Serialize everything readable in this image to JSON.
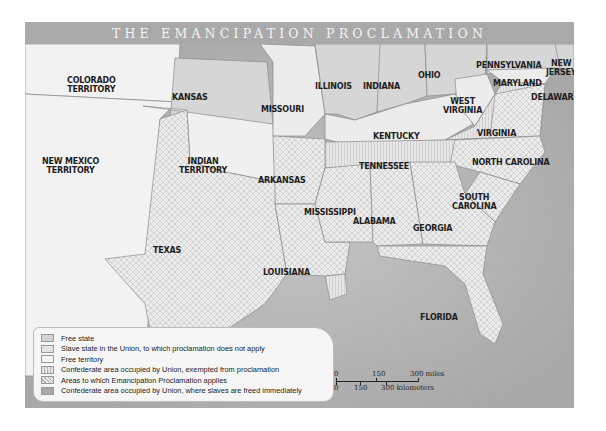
{
  "title": "THE EMANCIPATION PROCLAMATION",
  "colors": {
    "free_state": "#d2d2d2",
    "slave_state_union": "#ececec",
    "free_territory": "#f2f2f2",
    "confederate_exempted": "#e2e2e2",
    "proclamation_applies": "#ebebeb",
    "confederate_freed_immediately": "#a8a8a8",
    "water": "#bdbdbd",
    "title_bar": "#a9a9a9"
  },
  "regions": {
    "colorado": "COLORADO\nTERRITORY",
    "kansas": "KANSAS",
    "missouri": "MISSOURI",
    "illinois": "ILLINOIS",
    "indiana": "INDIANA",
    "ohio": "OHIO",
    "pennsylvania": "PENNSYLVANIA",
    "new_jersey": "NEW\nJERSEY",
    "maryland": "MARYLAND",
    "delaware": "DELAWARE",
    "west_virginia": "WEST\nVIRGINIA",
    "virginia": "VIRGINIA",
    "kentucky": "KENTUCKY",
    "new_mexico": "NEW MEXICO\nTERRITORY",
    "indian_territory": "INDIAN\nTERRITORY",
    "arkansas": "ARKANSAS",
    "tennessee": "TENNESSEE",
    "north_carolina": "NORTH CAROLINA",
    "south_carolina": "SOUTH\nCAROLINA",
    "mississippi": "MISSISSIPPI",
    "alabama": "ALABAMA",
    "georgia": "GEORGIA",
    "texas": "TEXAS",
    "louisiana": "LOUISIANA",
    "florida": "FLORIDA"
  },
  "legend": [
    {
      "label": "Free state",
      "key": "free_state"
    },
    {
      "label": "Slave state in the Union, to which proclamation does not apply",
      "key": "slave_state_union"
    },
    {
      "label": "Free territory",
      "key": "free_territory"
    },
    {
      "label": "Confederate area occupied by Union, exempted from proclamation",
      "key": "confederate_exempted"
    },
    {
      "label": "Areas to which Emancipation Proclamation applies",
      "key": "proclamation_applies"
    },
    {
      "label": "Confederate area occupied by Union, where slaves are freed immediately",
      "key": "confederate_freed_immediately"
    }
  ],
  "scale": {
    "miles": [
      "0",
      "150",
      "300 miles"
    ],
    "kilometers": [
      "0",
      "150",
      "300 kilometers"
    ]
  }
}
